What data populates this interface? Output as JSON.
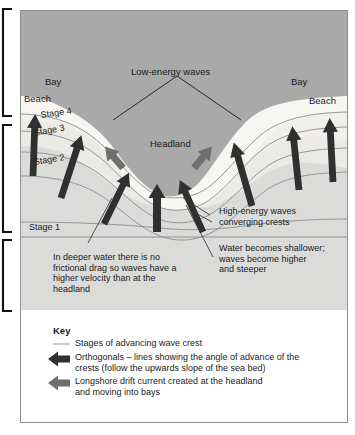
{
  "figure": {
    "title_labels": {
      "low_energy": "Low-energy waves",
      "headland": "Headland",
      "bay_left": "Bay",
      "bay_right": "Bay",
      "beach_left": "Beach",
      "beach_right": "Beach"
    },
    "stages": [
      {
        "id": "stage4",
        "label": "Stage 4"
      },
      {
        "id": "stage3",
        "label": "Stage 3"
      },
      {
        "id": "stage2",
        "label": "Stage 2"
      },
      {
        "id": "stage1",
        "label": "Stage 1"
      }
    ],
    "annotations": {
      "high_energy": "High-energy waves\nconverging crests",
      "shallower": "Water becomes shallower;\nwaves become higher\nand steeper",
      "deeper": "In deeper water there is no\nfrictional drag so waves have a\nhigher velocity than at the\nheadland"
    }
  },
  "key": {
    "title": "Key",
    "entries": [
      {
        "symbol": "line-symbol",
        "text": "Stages of advancing wave crest"
      },
      {
        "symbol": "black-arrow-symbol",
        "text": "Orthogonals – lines showing the angle of advance of the\ncrests (follow the upwards slope of the sea bed)"
      },
      {
        "symbol": "gray-arrow-symbol",
        "text": "Longshore drift current created at the headland\nand moving into bays"
      }
    ]
  },
  "colors": {
    "land": "#a9a9a9",
    "beach": "#f6f5f2",
    "water_shallow": "#ededeb",
    "water_mid": "#e4e4e2",
    "water_deep": "#dcdcda",
    "crest_line": "#8a8a8a",
    "orthogonal_arrow": "#2f2f2f",
    "longshore_arrow": "#6d6d6d",
    "frame": "#8e8e8e",
    "key_bg": "#ffffff",
    "bracket": "#111111"
  }
}
